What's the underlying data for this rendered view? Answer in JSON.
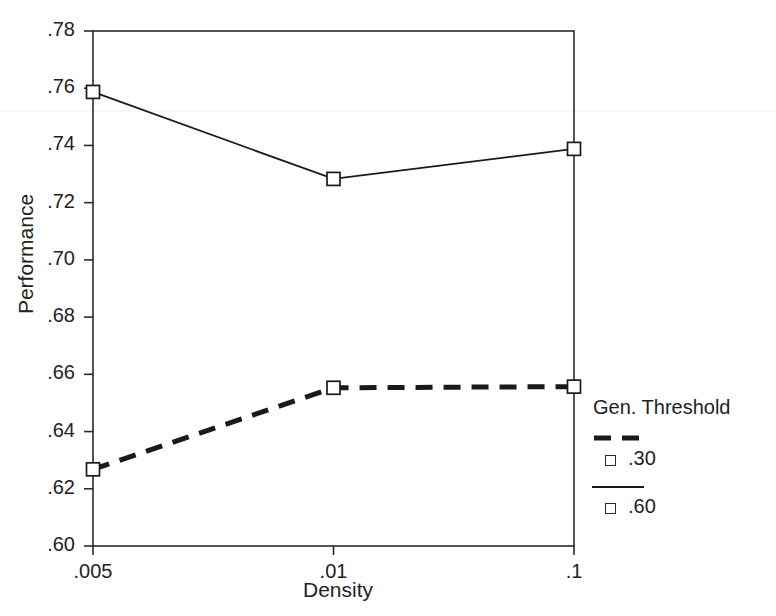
{
  "chart_data": {
    "type": "line",
    "title": "",
    "xlabel": "Density",
    "ylabel": "Performance",
    "categories": [
      ".005",
      ".01",
      ".1"
    ],
    "x_tick_labels": [
      ".005",
      ".01",
      ".1"
    ],
    "y_tick_labels": [
      ".60",
      ".62",
      ".64",
      ".66",
      ".68",
      ".70",
      ".72",
      ".74",
      ".76",
      ".78"
    ],
    "y_tick_values": [
      0.6,
      0.62,
      0.64,
      0.66,
      0.68,
      0.7,
      0.72,
      0.74,
      0.76,
      0.78
    ],
    "ylim": [
      0.6,
      0.78
    ],
    "grid": false,
    "legend_position": "right",
    "legend_title": "Gen. Threshold",
    "series": [
      {
        "name": ".30",
        "style": "dashed",
        "marker": "open-square",
        "color": "#1a1a1a",
        "values": [
          0.6268,
          0.6553,
          0.6557
        ]
      },
      {
        "name": ".60",
        "style": "solid",
        "marker": "open-square",
        "color": "#1a1a1a",
        "values": [
          0.7587,
          0.7283,
          0.7388
        ]
      }
    ]
  },
  "legend": {
    "title": "Gen. Threshold",
    "entries": [
      {
        "label": ".30",
        "style": "dashed"
      },
      {
        "label": ".60",
        "style": "solid"
      }
    ]
  },
  "axes": {
    "x_title": "Density",
    "y_title": "Performance"
  }
}
